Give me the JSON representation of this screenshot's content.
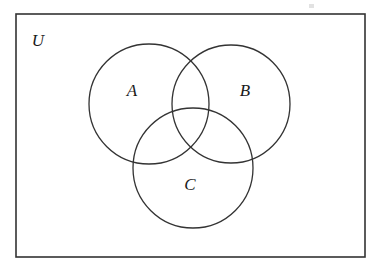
{
  "figure": {
    "background_color": "#ffffff",
    "line_color": "#333333",
    "label_color": "#1a1a1a"
  },
  "universe": {
    "label": "U",
    "label_x": 38,
    "label_y": 42,
    "rect": {
      "x": 16,
      "y": 14,
      "width": 349,
      "height": 243
    },
    "stroke_width": 1.6
  },
  "sets": [
    {
      "label": "A",
      "cx": 149,
      "cy": 104,
      "r": 60,
      "label_x": 132,
      "label_y": 92
    },
    {
      "label": "B",
      "cx": 231,
      "cy": 104,
      "r": 59,
      "label_x": 245,
      "label_y": 92
    },
    {
      "label": "C",
      "cx": 193,
      "cy": 168,
      "r": 60,
      "label_x": 190,
      "label_y": 186
    }
  ],
  "artifact": {
    "name": "scan-speck",
    "x": 309,
    "y": 4,
    "width": 5,
    "height": 4
  }
}
